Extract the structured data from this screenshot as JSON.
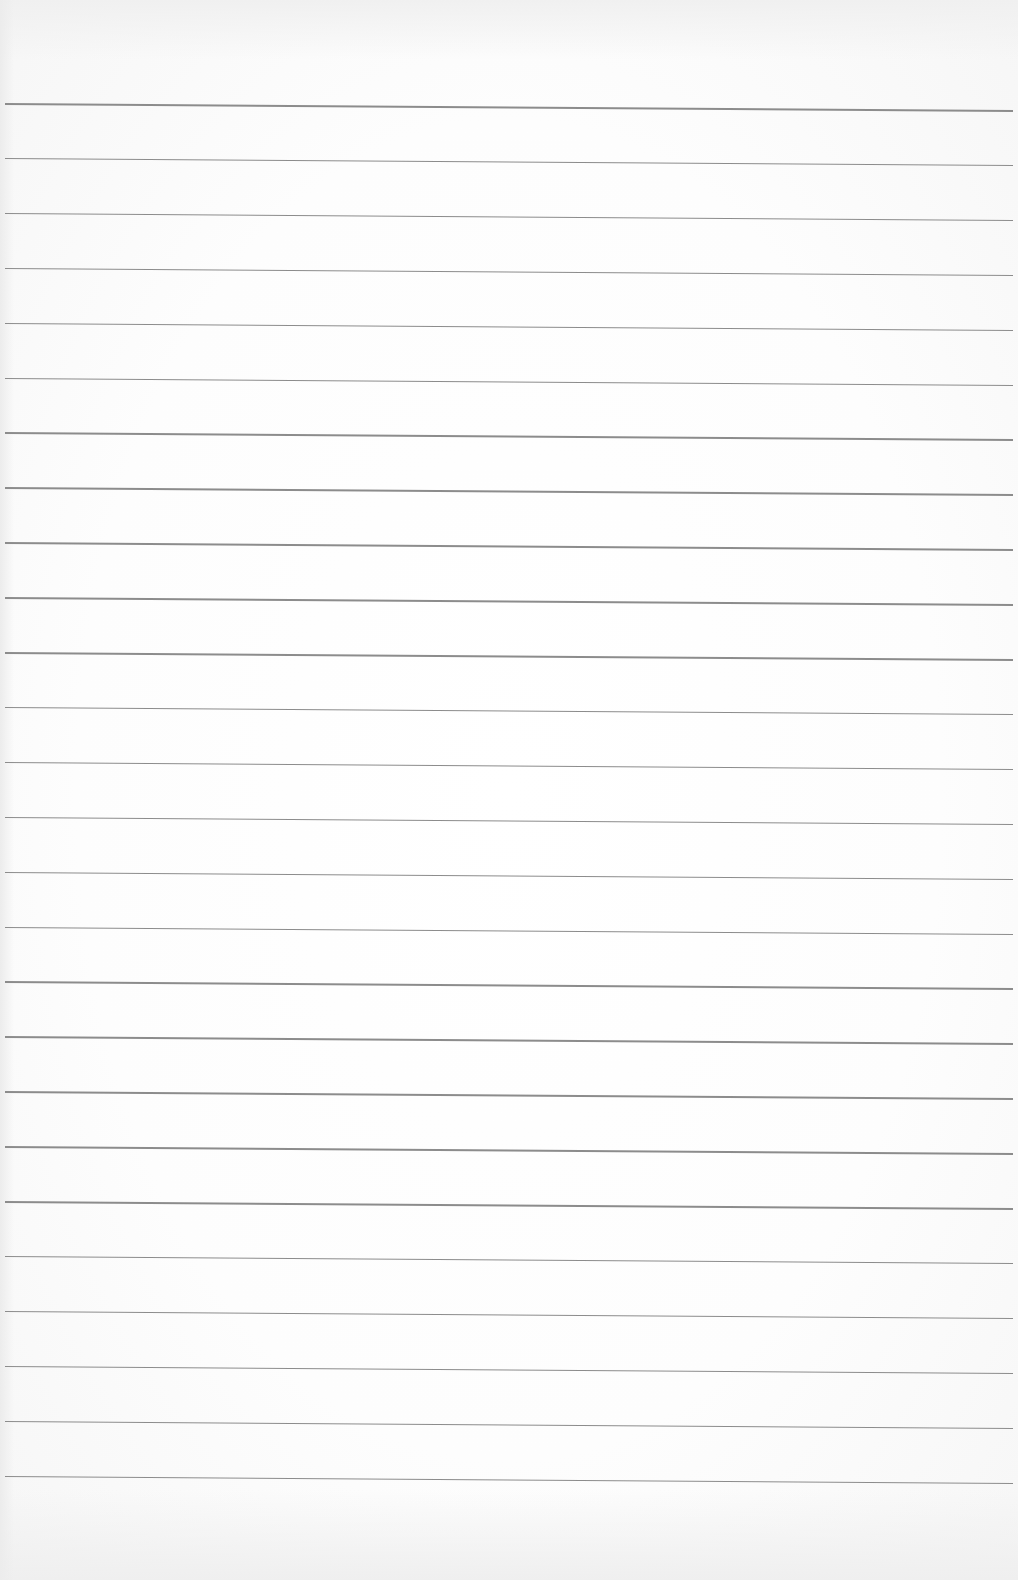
{
  "page": {
    "type": "ruled-paper",
    "background_color": "#fdfdfd",
    "rule_color": "#8c8c8c",
    "rule_count": 26,
    "first_rule_y": 103,
    "rule_spacing": 54.9
  }
}
